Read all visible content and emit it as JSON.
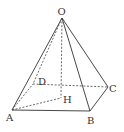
{
  "diagram": {
    "type": "square-pyramid",
    "points": {
      "O": {
        "label": "O",
        "x": 62,
        "y": 18
      },
      "A": {
        "label": "A",
        "x": 12,
        "y": 110
      },
      "B": {
        "label": "B",
        "x": 90,
        "y": 111
      },
      "C": {
        "label": "C",
        "x": 108,
        "y": 87
      },
      "D": {
        "label": "D",
        "x": 33,
        "y": 84
      },
      "H": {
        "label": "H",
        "x": 61,
        "y": 98
      }
    },
    "solid_edges": [
      "OA",
      "OB",
      "OC",
      "AB",
      "BC"
    ],
    "dashed_edges": [
      "OD",
      "OH",
      "AD",
      "DC",
      "AH"
    ],
    "line_color": "#333333"
  }
}
